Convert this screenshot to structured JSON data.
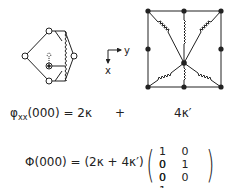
{
  "diagram": {
    "left_cluster": {
      "description": "diamond of four atoms with displaced central atom coupled by springs",
      "nodes": [
        {
          "id": "top",
          "x": 49,
          "y": 31,
          "style": "open"
        },
        {
          "id": "left",
          "x": 25,
          "y": 56,
          "style": "open"
        },
        {
          "id": "bottom",
          "x": 49,
          "y": 81,
          "style": "open"
        },
        {
          "id": "right",
          "x": 74,
          "y": 56,
          "style": "open"
        },
        {
          "id": "center",
          "x": 49,
          "y": 66,
          "style": "crossed"
        }
      ],
      "displaced_marker": "○"
    },
    "axes": {
      "x_label": "x",
      "y_label": "y"
    },
    "right_cluster": {
      "description": "square of eight atoms with central atom connected by springs to corners and edge midpoints",
      "nodes": [
        {
          "id": "tl",
          "x": 148,
          "y": 11
        },
        {
          "id": "tm",
          "x": 184,
          "y": 11
        },
        {
          "id": "tr",
          "x": 221,
          "y": 11
        },
        {
          "id": "ml",
          "x": 148,
          "y": 49
        },
        {
          "id": "mr",
          "x": 221,
          "y": 49
        },
        {
          "id": "bl",
          "x": 148,
          "y": 87
        },
        {
          "id": "bm",
          "x": 184,
          "y": 87
        },
        {
          "id": "br",
          "x": 221,
          "y": 87
        },
        {
          "id": "center",
          "x": 184,
          "y": 63
        }
      ]
    },
    "colors": {
      "ink": "#222222",
      "background": "#ffffff"
    }
  },
  "equations": {
    "line1": {
      "lhs_symbol": "φ",
      "lhs_sub": "xx",
      "lhs_rest": "(000) = 2κ",
      "plus": "+",
      "rhs": "4κ′"
    },
    "line2": {
      "lhs": "Φ(000) = (2κ + 4κ′)",
      "matrix": [
        [
          "1",
          "0",
          "0"
        ],
        [
          "0",
          "1",
          "0"
        ],
        [
          "0",
          "0",
          "1"
        ]
      ],
      "matrix_rows": [
        "1 0 0",
        "0 1 0",
        "0 0 1"
      ],
      "open_paren": "(",
      "close_paren": ")"
    }
  }
}
